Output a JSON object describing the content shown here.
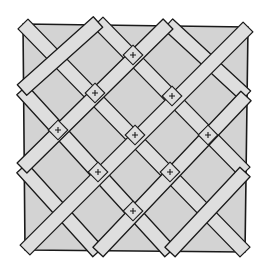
{
  "diagram": {
    "title": "",
    "colors": {
      "background": "#ffffff",
      "panel_fill": "#d3d3d3",
      "band_fill": "#dedede",
      "stroke": "#1a1a1a"
    },
    "panel": {
      "corners": [
        [
          23,
          24
        ],
        [
          248,
          27
        ],
        [
          245,
          252
        ],
        [
          25,
          250
        ]
      ]
    },
    "band_width": 14,
    "bands_down_right": [
      {
        "from": [
          23,
          24
        ],
        "to": [
          245,
          252
        ]
      },
      {
        "from": [
          98,
          22
        ],
        "to": [
          245,
          172
        ]
      },
      {
        "from": [
          168,
          24
        ],
        "to": [
          246,
          96
        ]
      },
      {
        "from": [
          22,
          90
        ],
        "to": [
          170,
          252
        ]
      },
      {
        "from": [
          22,
          168
        ],
        "to": [
          98,
          252
        ]
      }
    ],
    "bands_up_right": [
      {
        "from": [
          25,
          250
        ],
        "to": [
          248,
          27
        ]
      },
      {
        "from": [
          22,
          168
        ],
        "to": [
          168,
          24
        ]
      },
      {
        "from": [
          22,
          90
        ],
        "to": [
          98,
          22
        ]
      },
      {
        "from": [
          98,
          252
        ],
        "to": [
          246,
          96
        ]
      },
      {
        "from": [
          170,
          252
        ],
        "to": [
          245,
          172
        ]
      }
    ],
    "cross_marks": [
      [
        133,
        55
      ],
      [
        95,
        93
      ],
      [
        172,
        96
      ],
      [
        58,
        130
      ],
      [
        135,
        135
      ],
      [
        208,
        135
      ],
      [
        98,
        172
      ],
      [
        170,
        172
      ],
      [
        133,
        211
      ]
    ]
  }
}
